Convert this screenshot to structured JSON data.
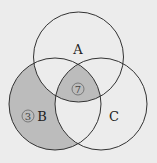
{
  "diagram": {
    "type": "venn-3",
    "colors": {
      "background": "#ececec",
      "shade": "#bcbcbc",
      "stroke": "#333333"
    },
    "sets": [
      {
        "name": "A",
        "cx": 78.5,
        "cy": 57,
        "r": 45,
        "label_x": 78,
        "label_y": 54
      },
      {
        "name": "B",
        "cx": 55,
        "cy": 104,
        "r": 46,
        "label_x": 42,
        "label_y": 121
      },
      {
        "name": "C",
        "cx": 101,
        "cy": 104,
        "r": 46,
        "label_x": 114,
        "label_y": 121
      }
    ],
    "shaded_regions": [
      "B only",
      "A∩B∩C"
    ],
    "region_counts": [
      {
        "region": "B only",
        "value": "3",
        "x": 28,
        "y": 116
      },
      {
        "region": "A∩B∩C",
        "value": "7",
        "x": 78,
        "y": 89
      }
    ]
  }
}
